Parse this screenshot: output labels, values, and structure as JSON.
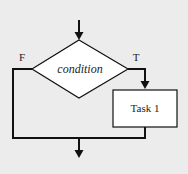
{
  "diagram": {
    "type": "flowchart",
    "decision": {
      "label": "condition",
      "true_branch_label": "T",
      "false_branch_label": "F"
    },
    "process": {
      "label": "Task 1"
    },
    "colors": {
      "background": "#ececec",
      "shape_fill": "#ffffff",
      "stroke": "#111111",
      "text": "#222222"
    }
  }
}
